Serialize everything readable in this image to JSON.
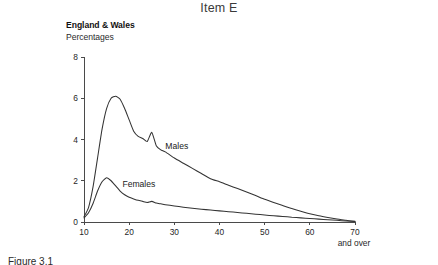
{
  "title": "Item E",
  "header": {
    "region": "England & Wales",
    "units": "Percentages"
  },
  "axes": {
    "x_ticks": [
      "10",
      "20",
      "30",
      "40",
      "50",
      "60",
      "70"
    ],
    "x_note": "and over",
    "y_ticks": [
      "0",
      "2",
      "4",
      "6",
      "8"
    ]
  },
  "series_labels": {
    "males": "Males",
    "females": "Females"
  },
  "caption": "Figure 3.1",
  "colors": {
    "curve": "#333333",
    "axis": "#4a4a4a",
    "text": "#1a1a1a",
    "background": "#ffffff"
  },
  "chart_data": {
    "type": "line",
    "title": "Item E",
    "subtitle": "England & Wales",
    "xlabel": "",
    "ylabel": "Percentages",
    "xlim": [
      10,
      70
    ],
    "ylim": [
      0,
      8
    ],
    "grid": false,
    "legend": "inline-labels",
    "x": [
      10,
      11,
      12,
      13,
      14,
      15,
      16,
      17,
      18,
      19,
      20,
      21,
      22,
      23,
      24,
      25,
      26,
      27,
      28,
      30,
      32,
      34,
      36,
      38,
      40,
      42,
      44,
      46,
      48,
      50,
      52,
      54,
      56,
      58,
      60,
      62,
      64,
      66,
      68,
      70
    ],
    "series": [
      {
        "name": "Males",
        "values": [
          0.25,
          0.7,
          1.7,
          3.1,
          4.5,
          5.5,
          6.0,
          6.1,
          5.95,
          5.5,
          4.95,
          4.4,
          4.15,
          4.05,
          3.9,
          4.35,
          3.7,
          3.5,
          3.4,
          3.1,
          2.85,
          2.6,
          2.35,
          2.1,
          1.95,
          1.78,
          1.62,
          1.45,
          1.28,
          1.1,
          0.95,
          0.8,
          0.65,
          0.52,
          0.4,
          0.3,
          0.22,
          0.15,
          0.08,
          0.03
        ]
      },
      {
        "name": "Females",
        "values": [
          0.2,
          0.45,
          0.9,
          1.5,
          1.95,
          2.15,
          2.0,
          1.75,
          1.5,
          1.32,
          1.2,
          1.12,
          1.05,
          1.0,
          0.95,
          1.0,
          0.92,
          0.88,
          0.84,
          0.78,
          0.72,
          0.67,
          0.62,
          0.58,
          0.54,
          0.5,
          0.46,
          0.42,
          0.38,
          0.34,
          0.3,
          0.27,
          0.23,
          0.2,
          0.17,
          0.14,
          0.11,
          0.08,
          0.05,
          0.02
        ]
      }
    ],
    "annotations": [
      {
        "text": "Males",
        "x": 28,
        "y": 3.55
      },
      {
        "text": "Females",
        "x": 18.5,
        "y": 1.72
      },
      {
        "text": "and over",
        "x": 70,
        "y": -0.95
      }
    ]
  }
}
